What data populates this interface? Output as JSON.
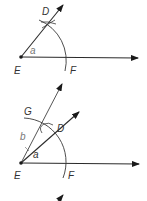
{
  "diagram": {
    "type": "geometric-construction",
    "colors": {
      "line": "#2b2b2b",
      "arc": "#3a3a3a",
      "text": "#333333",
      "text_light": "#777777"
    },
    "step1": {
      "labels": {
        "D": "D",
        "a": "a",
        "E": "E",
        "F": "F"
      }
    },
    "step2": {
      "labels": {
        "G": "G",
        "b": "b",
        "D": "D",
        "a": "a",
        "E": "E",
        "F": "F"
      }
    },
    "step3_partial": {
      "visible": "arrowhead tip only"
    }
  }
}
